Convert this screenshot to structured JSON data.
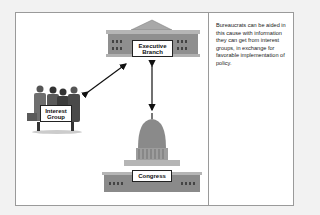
{
  "diagram": {
    "nodes": [
      {
        "id": "executive",
        "label_line1": "Executive",
        "label_line2": "Branch"
      },
      {
        "id": "interest",
        "label_line1": "Interest",
        "label_line2": "Group"
      },
      {
        "id": "congress",
        "label": "Congress"
      }
    ],
    "edges": [
      {
        "from": "interest",
        "to": "executive",
        "type": "bidirectional-arrow"
      },
      {
        "from": "executive",
        "to": "congress",
        "type": "bidirectional-arrow"
      }
    ]
  },
  "caption": {
    "text": "Bureaucrats can be aided in this cause with information they can get from interest groups, in exchange for favorable implementation of policy."
  },
  "colors": {
    "background": "#f2f2f2",
    "panel": "#ffffff",
    "building_gray": "#8c8c8c",
    "border": "#9a9a9a"
  }
}
